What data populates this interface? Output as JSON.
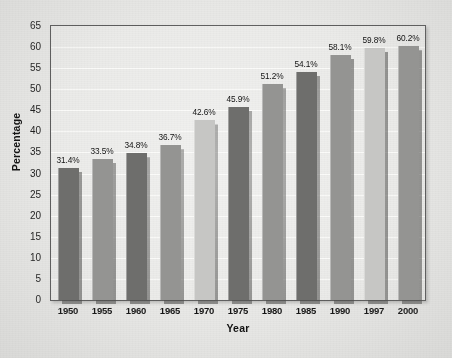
{
  "chart_data": {
    "type": "bar",
    "title": "",
    "xlabel": "Year",
    "ylabel": "Percentage",
    "categories": [
      "1950",
      "1955",
      "1960",
      "1965",
      "1970",
      "1975",
      "1980",
      "1985",
      "1990",
      "1997",
      "2000"
    ],
    "values": [
      31.4,
      33.5,
      34.8,
      36.7,
      42.6,
      45.9,
      51.2,
      54.1,
      58.1,
      59.8,
      60.2
    ],
    "data_labels": [
      "31.4%",
      "33.5%",
      "34.8%",
      "36.7%",
      "42.6%",
      "45.9%",
      "51.2%",
      "54.1%",
      "58.1%",
      "59.8%",
      "60.2%"
    ],
    "bar_colors": [
      "#6e6e6c",
      "#949492",
      "#6e6e6c",
      "#949492",
      "#c6c6c4",
      "#6e6e6c",
      "#949492",
      "#6e6e6c",
      "#949492",
      "#c6c6c4",
      "#949492"
    ],
    "ylim": [
      0,
      65
    ],
    "yticks": [
      0,
      5,
      10,
      15,
      20,
      25,
      30,
      35,
      40,
      45,
      50,
      55,
      60,
      65
    ],
    "ytick_labels": [
      "0",
      "5",
      "10",
      "15",
      "20",
      "25",
      "30",
      "35",
      "40",
      "45",
      "50",
      "55",
      "60",
      "65"
    ],
    "grid": true,
    "gridline_color": "#fafaf8",
    "legend": null,
    "plot_background": "#ebebe9",
    "figure_background": "#e8e8e6",
    "axis_color": "#5d5d5d",
    "bar_shadow": true
  }
}
